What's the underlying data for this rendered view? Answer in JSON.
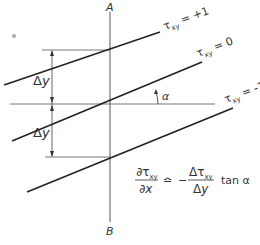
{
  "diagram": {
    "axis": {
      "top_label": "A",
      "bottom_label": "B"
    },
    "lines": [
      {
        "symbol": "τ",
        "subscript": "xy",
        "relation": "=",
        "value": "+1"
      },
      {
        "symbol": "τ",
        "subscript": "xy",
        "relation": "=",
        "value": "0"
      },
      {
        "symbol": "τ",
        "subscript": "xy",
        "relation": "=",
        "value": "-1"
      }
    ],
    "angle_label": "α",
    "spacing_labels": [
      "Δy",
      "Δy"
    ],
    "formula": {
      "lhs_num": "∂τ",
      "lhs_num_sub": "xy",
      "lhs_den": "∂x",
      "approx": "≏",
      "minus": "−",
      "rhs_num": "Δτ",
      "rhs_num_sub": "xy",
      "rhs_den": "Δy",
      "trailing": "tan α"
    },
    "colors": {
      "ink": "#222222",
      "thin": "#555555"
    }
  }
}
